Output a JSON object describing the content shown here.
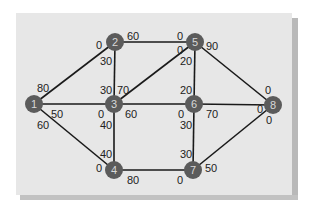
{
  "diagram": {
    "type": "network-flow-graph",
    "colors": {
      "panel": "#e7e7e7",
      "node": "#5b5b5b",
      "node_text": "#d8d8d8",
      "edge": "#1a1a1a",
      "label": "#222222"
    },
    "nodes": [
      {
        "id": "1",
        "label": "1",
        "x": 34,
        "y": 104
      },
      {
        "id": "2",
        "label": "2",
        "x": 115,
        "y": 42
      },
      {
        "id": "3",
        "label": "3",
        "x": 114,
        "y": 104
      },
      {
        "id": "4",
        "label": "4",
        "x": 114,
        "y": 170
      },
      {
        "id": "5",
        "label": "5",
        "x": 195,
        "y": 42
      },
      {
        "id": "6",
        "label": "6",
        "x": 194,
        "y": 104
      },
      {
        "id": "7",
        "label": "7",
        "x": 193,
        "y": 170
      },
      {
        "id": "8",
        "label": "8",
        "x": 273,
        "y": 105
      }
    ],
    "edges": [
      {
        "from": "1",
        "to": "2",
        "cap_from": "80",
        "cap_to": "0"
      },
      {
        "from": "1",
        "to": "3",
        "cap_from": "50",
        "cap_to": "0"
      },
      {
        "from": "1",
        "to": "4",
        "cap_from": "60",
        "cap_to": "0"
      },
      {
        "from": "2",
        "to": "3",
        "cap_from": "30",
        "cap_to": "30"
      },
      {
        "from": "2",
        "to": "5",
        "cap_from": "60",
        "cap_to": "0"
      },
      {
        "from": "3",
        "to": "5",
        "cap_from": "70",
        "cap_to": "0"
      },
      {
        "from": "3",
        "to": "6",
        "cap_from": "60",
        "cap_to": "0"
      },
      {
        "from": "3",
        "to": "4",
        "cap_from": "40",
        "cap_to": "40"
      },
      {
        "from": "5",
        "to": "6",
        "cap_from": "20",
        "cap_to": "20"
      },
      {
        "from": "5",
        "to": "8",
        "cap_from": "90",
        "cap_to": "0"
      },
      {
        "from": "6",
        "to": "8",
        "cap_from": "70",
        "cap_to": "0"
      },
      {
        "from": "6",
        "to": "7",
        "cap_from": "30",
        "cap_to": "30"
      },
      {
        "from": "4",
        "to": "7",
        "cap_from": "80",
        "cap_to": "0"
      },
      {
        "from": "7",
        "to": "8",
        "cap_from": "50",
        "cap_to": "0"
      }
    ],
    "labels": {
      "e12_1": "80",
      "e12_2": "0",
      "e13_1": "50",
      "e13_3": "0",
      "e14_1": "60",
      "e14_4": "0",
      "e23_2": "30",
      "e23_3": "30",
      "e25_2": "60",
      "e25_5": "0",
      "e35_3": "70",
      "e35_5": "0",
      "e36_3": "60",
      "e36_6": "0",
      "e34_3": "40",
      "e34_4": "40",
      "e56_5": "20",
      "e56_6": "20",
      "e58_5": "90",
      "e58_8": "0",
      "e68_6": "70",
      "e68_8": "0",
      "e67_6": "30",
      "e67_7": "30",
      "e47_4": "80",
      "e47_7": "0",
      "e78_7": "50",
      "e78_8": "0"
    },
    "node_labels": {
      "n1": "1",
      "n2": "2",
      "n3": "3",
      "n4": "4",
      "n5": "5",
      "n6": "6",
      "n7": "7",
      "n8": "8"
    }
  }
}
